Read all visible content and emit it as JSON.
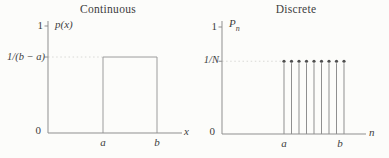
{
  "colors": {
    "background": "#fcfcfa",
    "axis": "#8f8f8f",
    "shape": "#9c9c9c",
    "dotted_guide": "#d9d9d6",
    "stem": "#8f8f8f",
    "stem_dot": "#4f4f4f",
    "text": "#3d3d3d"
  },
  "chart_data": [
    {
      "type": "line",
      "variant": "uniform-pdf-rectangle",
      "title": "Continuous",
      "xlabel": "x",
      "ylabel": "p(x)",
      "yticks": [
        "1",
        "1/(b − a)",
        "0"
      ],
      "xticks": [
        "a",
        "b"
      ],
      "grid": false,
      "legend": false,
      "series": [
        {
          "name": "p(x)",
          "points": [
            {
              "x": "a",
              "y": "1/(b − a)"
            },
            {
              "x": "b",
              "y": "1/(b − a)"
            }
          ],
          "value_outside_ab": 0
        }
      ],
      "level_label": "1/(b − a)",
      "level_fraction_of_unit": 0.71,
      "annotation": "dotted guide line from y-axis at height 1/(b − a) to left edge of rectangle"
    },
    {
      "type": "scatter",
      "variant": "stem",
      "title": "Discrete",
      "xlabel": "n",
      "ylabel": "P",
      "ylabel_sub": "n",
      "yticks": [
        "1",
        "1/N",
        "0"
      ],
      "xticks": [
        "a",
        "b"
      ],
      "grid": false,
      "legend": false,
      "stem_count": 9,
      "stem_value": "1/N",
      "level_fraction_of_unit": 0.68,
      "series": [
        {
          "name": "Pn",
          "x_range": [
            "a",
            "b"
          ],
          "y_each": "1/N",
          "count": 9
        }
      ],
      "annotation": "dotted guide line from y-axis at height 1/N to first stem"
    }
  ]
}
